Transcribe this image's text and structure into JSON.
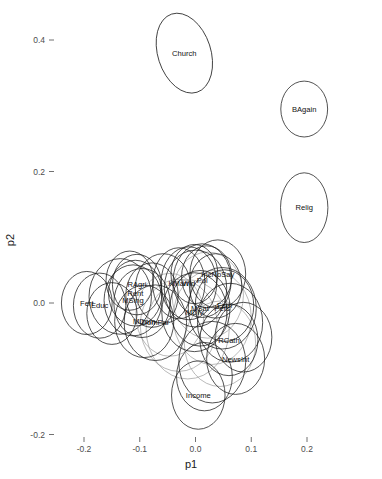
{
  "chart_data": {
    "type": "scatter",
    "title": "",
    "subtitle": "",
    "xlabel": "p1",
    "ylabel": "p2",
    "xlim": [
      -0.27,
      0.27
    ],
    "ylim": [
      -0.215,
      0.475
    ],
    "grid": false,
    "legend": "none",
    "xticks": [
      "-0.2",
      "-0.1",
      "0.0",
      "0.1",
      "0.2"
    ],
    "xtickvals": [
      -0.2,
      -0.1,
      0.0,
      0.1,
      0.2
    ],
    "yticks": [
      "0.4",
      "0.2",
      "0.0",
      "-0.2"
    ],
    "ytickvals": [
      0.4,
      0.2,
      0.0,
      -0.2
    ],
    "marker": "confidence-ellipse",
    "annotation_note": "Each item is drawn as a confidence ellipse with its variable name at the ellipse centre.",
    "points": [
      {
        "label": "Church",
        "x": -0.02,
        "y": 0.38,
        "rx": 0.0475,
        "ry": 0.0625,
        "rot": -18,
        "faint": false
      },
      {
        "label": "BAgain",
        "x": 0.195,
        "y": 0.295,
        "rx": 0.042,
        "ry": 0.0425,
        "rot": 0,
        "faint": false
      },
      {
        "label": "Relig",
        "x": 0.195,
        "y": 0.145,
        "rx": 0.0425,
        "ry": 0.053,
        "rot": 0,
        "faint": false
      },
      {
        "label": "Fert",
        "x": -0.195,
        "y": 0.0,
        "rx": 0.0455,
        "ry": 0.048,
        "rot": 0,
        "faint": false
      },
      {
        "label": "Educ",
        "x": -0.172,
        "y": -0.004,
        "rx": 0.047,
        "ry": 0.0495,
        "rot": 0,
        "faint": false
      },
      {
        "label": "RAgri",
        "x": -0.105,
        "y": 0.028,
        "rx": 0.044,
        "ry": 0.046,
        "rot": 0,
        "faint": false
      },
      {
        "label": "Rent",
        "x": -0.108,
        "y": 0.015,
        "rx": 0.048,
        "ry": 0.05,
        "rot": 0,
        "faint": false
      },
      {
        "label": "MSing",
        "x": -0.112,
        "y": 0.004,
        "rx": 0.052,
        "ry": 0.054,
        "rot": 0,
        "faint": false
      },
      {
        "label": "MDom",
        "x": -0.092,
        "y": -0.028,
        "rx": 0.053,
        "ry": 0.055,
        "rot": 0,
        "faint": false
      },
      {
        "label": "DomPar",
        "x": -0.072,
        "y": -0.03,
        "rx": 0.056,
        "ry": 0.0575,
        "rot": 0,
        "faint": false
      },
      {
        "label": "KMarr",
        "x": -0.03,
        "y": 0.03,
        "rx": 0.047,
        "ry": 0.054,
        "rot": 0,
        "faint": false
      },
      {
        "label": "Wid",
        "x": -0.012,
        "y": 0.03,
        "rx": 0.05,
        "ry": 0.0555,
        "rot": 0,
        "faint": false
      },
      {
        "label": "Pol",
        "x": 0.012,
        "y": 0.034,
        "rx": 0.052,
        "ry": 0.056,
        "rot": 0,
        "faint": false
      },
      {
        "label": "IncNoSay",
        "x": 0.04,
        "y": 0.044,
        "rx": 0.05,
        "ry": 0.052,
        "rot": 0,
        "faint": false
      },
      {
        "label": "MSat",
        "x": 0.008,
        "y": -0.008,
        "rx": 0.054,
        "ry": 0.0575,
        "rot": 0,
        "faint": false
      },
      {
        "label": "MDiv",
        "x": -0.002,
        "y": -0.014,
        "rx": 0.0585,
        "ry": 0.06,
        "rot": 0,
        "faint": false
      },
      {
        "label": "Fem",
        "x": 0.052,
        "y": -0.004,
        "rx": 0.0525,
        "ry": 0.0545,
        "rot": 0,
        "faint": false
      },
      {
        "label": "Pers",
        "x": 0.048,
        "y": -0.008,
        "rx": 0.061,
        "ry": 0.062,
        "rot": 0,
        "faint": false
      },
      {
        "label": "RCath",
        "x": 0.06,
        "y": -0.056,
        "rx": 0.052,
        "ry": 0.0545,
        "rot": 0,
        "faint": false
      },
      {
        "label": "NewsInt",
        "x": 0.072,
        "y": -0.085,
        "rx": 0.052,
        "ry": 0.054,
        "rot": 0,
        "faint": false
      },
      {
        "label": "Income",
        "x": 0.005,
        "y": -0.14,
        "rx": 0.048,
        "ry": 0.052,
        "rot": 0,
        "faint": false
      }
    ],
    "extra_ellipses": [
      {
        "x": -0.135,
        "y": 0.01,
        "rx": 0.056,
        "ry": 0.0575,
        "rot": 0,
        "faint": false
      },
      {
        "x": -0.118,
        "y": 0.034,
        "rx": 0.0425,
        "ry": 0.045,
        "rot": 0,
        "faint": false
      },
      {
        "x": -0.058,
        "y": 0.022,
        "rx": 0.05,
        "ry": 0.053,
        "rot": 0,
        "faint": false
      },
      {
        "x": -0.046,
        "y": -0.018,
        "rx": 0.061,
        "ry": 0.063,
        "rot": 0,
        "faint": true
      },
      {
        "x": -0.03,
        "y": -0.034,
        "rx": 0.069,
        "ry": 0.07,
        "rot": 0,
        "faint": true
      },
      {
        "x": -0.014,
        "y": -0.04,
        "rx": 0.0745,
        "ry": 0.0755,
        "rot": 0,
        "faint": true
      },
      {
        "x": 0.022,
        "y": 0.012,
        "rx": 0.064,
        "ry": 0.0655,
        "rot": 0,
        "faint": true
      },
      {
        "x": 0.03,
        "y": -0.022,
        "rx": 0.07,
        "ry": 0.0715,
        "rot": 0,
        "faint": true
      },
      {
        "x": 0.036,
        "y": 0.026,
        "rx": 0.047,
        "ry": 0.049,
        "rot": 0,
        "faint": false
      },
      {
        "x": 0.02,
        "y": 0.04,
        "rx": 0.045,
        "ry": 0.047,
        "rot": 0,
        "faint": false
      },
      {
        "x": -0.002,
        "y": 0.044,
        "rx": 0.042,
        "ry": 0.045,
        "rot": 0,
        "faint": false
      },
      {
        "x": -0.078,
        "y": 0.012,
        "rx": 0.047,
        "ry": 0.049,
        "rot": 0,
        "faint": false
      },
      {
        "x": 0.062,
        "y": -0.03,
        "rx": 0.0585,
        "ry": 0.06,
        "rot": 0,
        "faint": false
      },
      {
        "x": 0.044,
        "y": -0.062,
        "rx": 0.064,
        "ry": 0.065,
        "rot": 0,
        "faint": true
      },
      {
        "x": 0.03,
        "y": -0.09,
        "rx": 0.06,
        "ry": 0.062,
        "rot": 0,
        "faint": false
      },
      {
        "x": -0.15,
        "y": -0.016,
        "rx": 0.045,
        "ry": 0.047,
        "rot": 0,
        "faint": false
      },
      {
        "x": 0.016,
        "y": -0.112,
        "rx": 0.05,
        "ry": 0.052,
        "rot": 0,
        "faint": false
      },
      {
        "x": 0.086,
        "y": -0.052,
        "rx": 0.051,
        "ry": 0.053,
        "rot": 0,
        "faint": false
      },
      {
        "x": 0.0,
        "y": 0.022,
        "rx": 0.056,
        "ry": 0.0585,
        "rot": 0,
        "faint": false
      },
      {
        "x": -0.096,
        "y": 0.0,
        "rx": 0.0505,
        "ry": 0.0525,
        "rot": 0,
        "faint": false
      }
    ]
  },
  "axes": {
    "x_title": "p1",
    "y_title": "p2"
  }
}
